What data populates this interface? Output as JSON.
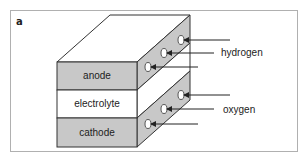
{
  "figure": {
    "panel_label": "a",
    "layers": [
      {
        "label": "anode",
        "fill": "#c8c8c8"
      },
      {
        "label": "electrolyte",
        "fill": "#ffffff"
      },
      {
        "label": "cathode",
        "fill": "#c8c8c8"
      }
    ],
    "gases": [
      {
        "label": "hydrogen",
        "inlet_count": 3
      },
      {
        "label": "oxygen",
        "inlet_count": 3
      }
    ],
    "colors": {
      "shaded": "#c8c8c8",
      "line": "#333333",
      "frame": "#b0b0b0"
    }
  }
}
